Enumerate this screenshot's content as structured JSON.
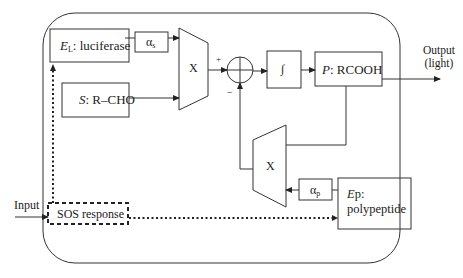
{
  "diagram": {
    "type": "block-diagram",
    "blocks": {
      "luciferase": {
        "var": "E",
        "sub": "L",
        "text": ": luciferase"
      },
      "alpha_s": {
        "sym": "α",
        "sub": "s"
      },
      "substrate": {
        "var": "S",
        "text": ": R–CHO"
      },
      "mult_top": {
        "label": "X"
      },
      "sum_plus": "+",
      "sum_minus": "−",
      "integrator": {
        "label": "∫"
      },
      "product": {
        "var": "P",
        "text": ": RCOOH"
      },
      "mult_bottom": {
        "label": "X"
      },
      "alpha_p": {
        "sym": "α",
        "sub": "p"
      },
      "polypeptide": {
        "var": "E",
        "text_line1": "p:",
        "text_line2": "polypeptide"
      },
      "sos": {
        "label": "SOS response"
      }
    },
    "io": {
      "input": "Input",
      "output_line1": "Output",
      "output_line2": "(light)"
    },
    "colors": {
      "stroke": "#222222",
      "background": "#ffffff"
    }
  }
}
